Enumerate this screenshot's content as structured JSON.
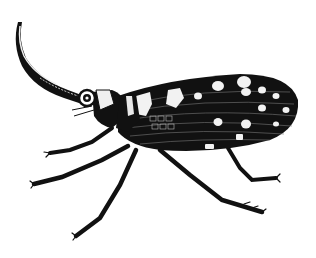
{
  "image": {
    "subject": "lanternfly insect illustration",
    "style": "black and white engraving",
    "background": "#ffffff",
    "ink": "#111111",
    "highlight": "#f2f2f2"
  }
}
